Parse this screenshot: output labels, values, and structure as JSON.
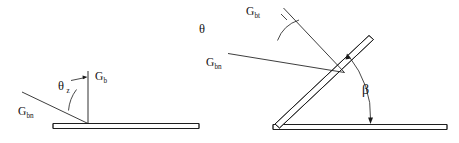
{
  "figure": {
    "background_color": "#ffffff",
    "line_color": "#1a1a1a",
    "width": 459,
    "height": 143
  },
  "left_diagram": {
    "name": "horizontal-surface-diagram",
    "labels": {
      "normal_irradiance": {
        "base": "G",
        "sub": "b"
      },
      "beam_normal": {
        "base": "G",
        "sub": "bn"
      },
      "zenith_angle": {
        "base": "θ",
        "sub": "z"
      }
    },
    "ground": {
      "name": "horizontal-ground-slab",
      "x1": 53,
      "x2": 199,
      "y": 126,
      "thickness": 5
    },
    "normal_line": {
      "x": 88,
      "y_top": 71,
      "y_bottom": 126
    },
    "beam_ray": {
      "x1": 22,
      "y1": 92,
      "x2": 88,
      "y2": 126
    },
    "zenith_arc": {
      "cx": 88,
      "cy": 126,
      "r": 40
    },
    "pointer": {
      "x1": 72,
      "y1": 80,
      "x2": 87,
      "y2": 77
    }
  },
  "right_diagram": {
    "name": "tilted-surface-diagram",
    "labels": {
      "beam_tilted": {
        "base": "G",
        "sub": "bt"
      },
      "beam_normal": {
        "base": "G",
        "sub": "bn"
      },
      "incidence_angle": {
        "base": "θ",
        "sub": ""
      },
      "tilt_angle": {
        "base": "β",
        "sub": ""
      }
    },
    "ground": {
      "name": "horizontal-ground-slab",
      "x1": 273,
      "x2": 447,
      "y": 127,
      "thickness": 5
    },
    "panel": {
      "name": "tilted-panel-slab",
      "x1": 276,
      "y1": 127,
      "x2": 371,
      "y2": 38,
      "thickness": 5
    },
    "ray_tilted": {
      "x1": 283,
      "y1": 7,
      "x2": 345,
      "y2": 72
    },
    "ray_normal": {
      "x1": 227,
      "y1": 53,
      "x2": 345,
      "y2": 72
    },
    "incidence_arc": {
      "cx": 283,
      "cy": 7,
      "r": 34
    },
    "tilt_arc": {
      "cx": 276,
      "cy": 127,
      "r": 96
    }
  }
}
